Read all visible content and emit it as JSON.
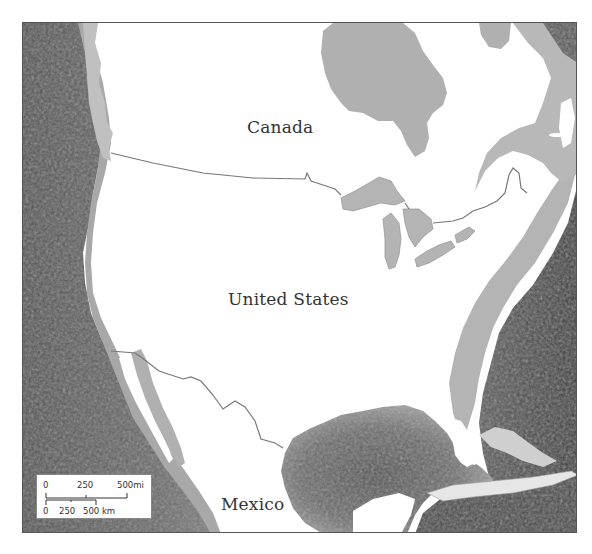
{
  "map": {
    "labels": {
      "canada": "Canada",
      "united_states": "United States",
      "mexico": "Mexico"
    },
    "colors": {
      "land": "#ffffff",
      "shelf": "#c8c8c8",
      "shallow_water": "#a9a9a9",
      "deep_ocean": "#5a5a5a",
      "deepest_ocean": "#3e3e3e",
      "border": "#777777",
      "frame": "#555555"
    },
    "scale_bar": {
      "miles": {
        "ticks": [
          "0",
          "250",
          "500mi"
        ]
      },
      "kilometers": {
        "ticks": [
          "0",
          "250",
          "500 km"
        ]
      }
    }
  }
}
